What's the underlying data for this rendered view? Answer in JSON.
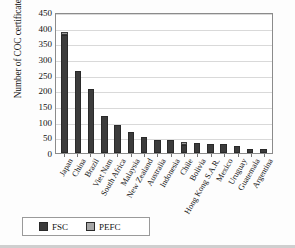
{
  "chart_data": {
    "type": "bar",
    "title": "",
    "subtitle": "",
    "xlabel": "",
    "ylabel": "Number of COC certificates",
    "ylim": [
      0,
      450
    ],
    "ytick_step": 50,
    "yticks": [
      450,
      400,
      350,
      300,
      250,
      200,
      150,
      100,
      50,
      0
    ],
    "grid": true,
    "stacked": true,
    "legend_position": "bottom-left",
    "categories": [
      "Japan",
      "China",
      "Brazil",
      "Viet Nam",
      "South Africa",
      "Malaysia",
      "New Zealand",
      "Australia",
      "Indonesia",
      "Chile",
      "Bolivia",
      "Hong Kong S.A.R.",
      "Mexico",
      "Uruguay",
      "Guatemala",
      "Argentina"
    ],
    "series": [
      {
        "name": "FSC",
        "color": "#3c3c3c",
        "values": [
          377,
          263,
          204,
          119,
          88,
          68,
          52,
          42,
          40,
          24,
          31,
          30,
          28,
          21,
          13,
          12
        ]
      },
      {
        "name": "PEFC",
        "color": "#9a9a9a",
        "values": [
          8,
          0,
          0,
          0,
          0,
          0,
          0,
          0,
          0,
          10,
          0,
          0,
          0,
          0,
          0,
          0
        ]
      }
    ],
    "totals": [
      385,
      263,
      204,
      119,
      88,
      68,
      52,
      42,
      40,
      34,
      31,
      30,
      28,
      21,
      13,
      12
    ]
  },
  "legend": {
    "items": [
      {
        "label": "FSC",
        "swatch": "fsc-swatch"
      },
      {
        "label": "PEFC",
        "swatch": "pefc-swatch"
      }
    ]
  }
}
